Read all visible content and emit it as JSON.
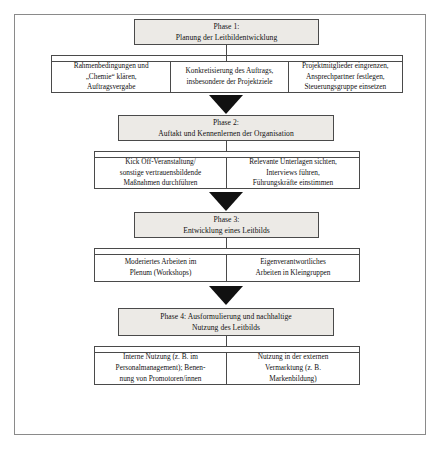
{
  "diagram": {
    "colors": {
      "frame_border": "#8a8a8a",
      "box_border": "#4a4a4a",
      "phase_fill": "#eceae6",
      "task_fill": "#ffffff",
      "arrow_fill": "#111111",
      "text": "#111111"
    },
    "phases": [
      {
        "id": "phase-1",
        "heading_lines": [
          "Phase 1:",
          "Planung der Leitbildentwicklung"
        ],
        "tasks": [
          {
            "id": "task-1-1",
            "lines": [
              "Rahmenbedingungen und",
              "„Chemie“ klären,",
              "Auftragsvergabe"
            ]
          },
          {
            "id": "task-1-2",
            "lines": [
              "Konkretisierung des Auftrags,",
              "insbesondere der Projektziele"
            ]
          },
          {
            "id": "task-1-3",
            "lines": [
              "Projektmitglieder eingrenzen,",
              "Ansprechpartner festlegen,",
              "Steuerungsgruppe einsetzen"
            ]
          }
        ]
      },
      {
        "id": "phase-2",
        "heading_lines": [
          "Phase 2:",
          "Auftakt und Kennenlernen der Organisation"
        ],
        "tasks": [
          {
            "id": "task-2-1",
            "lines": [
              "Kick Off-Veranstaltung/",
              "sonstige vertrauensbildende",
              "Maßnahmen durchführen"
            ]
          },
          {
            "id": "task-2-2",
            "lines": [
              "Relevante Unterlagen sichten,",
              "Interviews führen,",
              "Führungskräfte einstimmen"
            ]
          }
        ]
      },
      {
        "id": "phase-3",
        "heading_lines": [
          "Phase 3:",
          "Entwicklung eines Leitbilds"
        ],
        "tasks": [
          {
            "id": "task-3-1",
            "lines": [
              "Moderiertes Arbeiten im",
              "Plenum (Workshops)"
            ]
          },
          {
            "id": "task-3-2",
            "lines": [
              "Eigenverantwortliches",
              "Arbeiten in Kleingruppen"
            ]
          }
        ]
      },
      {
        "id": "phase-4",
        "heading_lines": [
          "Phase 4: Ausformulierung und nachhaltige",
          "Nutzung des Leitbilds"
        ],
        "tasks": [
          {
            "id": "task-4-1",
            "lines": [
              "Interne Nutzung (z. B. im",
              "Personalmanagement); Benen-",
              "nung von Promotoren/innen"
            ]
          },
          {
            "id": "task-4-2",
            "lines": [
              "Nutzung in der externen",
              "Vermarktung (z. B.",
              "Markenbildung)"
            ]
          }
        ]
      }
    ],
    "connectors": [
      {
        "id": "arrow-1-to-2",
        "label": "arrow-down"
      },
      {
        "id": "arrow-2-to-3",
        "label": "arrow-down"
      },
      {
        "id": "arrow-3-to-4",
        "label": "arrow-down"
      }
    ]
  }
}
